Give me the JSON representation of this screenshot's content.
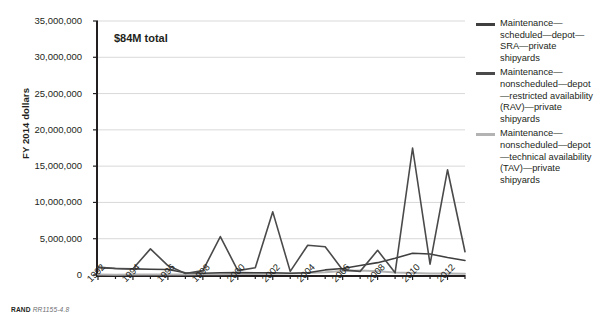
{
  "figure": {
    "annotation": "$84M total",
    "source_note_prefix": "RAND",
    "source_note_id": "RR1155-4.8"
  },
  "yaxis": {
    "title": "FY 2014 dollars",
    "ticks": [
      "0",
      "5,000,000",
      "10,000,000",
      "15,000,000",
      "20,000,000",
      "25,000,000",
      "30,000,000",
      "35,000,000"
    ],
    "tick_values": [
      0,
      5000000,
      10000000,
      15000000,
      20000000,
      25000000,
      30000000,
      35000000
    ],
    "min": 0,
    "max": 35000000
  },
  "xaxis": {
    "ticks": [
      "1992",
      "1994",
      "1996",
      "1998",
      "2000",
      "2002",
      "2004",
      "2006",
      "2008",
      "2010",
      "2012"
    ],
    "min": 1992,
    "max": 2013
  },
  "legend": {
    "items": [
      {
        "label": "Maintenance—scheduled—depot—SRA—private shipyards",
        "color": "#3f3f3f"
      },
      {
        "label": "Maintenance—nonscheduled—depot—restricted availability (RAV)—private shipyards",
        "color": "#4a4a4a"
      },
      {
        "label": "Maintenance—nonscheduled—depot—technical availability (TAV)—private shipyards",
        "color": "#b3b3b3"
      }
    ]
  },
  "chart_data": {
    "type": "line",
    "title": "",
    "xlabel": "",
    "ylabel": "FY 2014 dollars",
    "xlim": [
      1992,
      2013
    ],
    "ylim": [
      0,
      35000000
    ],
    "grid": "horizontal",
    "legend_position": "right",
    "annotations": [
      {
        "text": "$84M total",
        "x": 1993.2,
        "y": 32500000
      }
    ],
    "x": [
      1992,
      1993,
      1994,
      1995,
      1996,
      1997,
      1998,
      1999,
      2000,
      2001,
      2002,
      2003,
      2004,
      2005,
      2006,
      2007,
      2008,
      2009,
      2010,
      2011,
      2012,
      2013
    ],
    "series": [
      {
        "name": "Maintenance—scheduled—depot—SRA—private shipyards",
        "color": "#3f3f3f",
        "values": [
          1000000,
          900000,
          850000,
          800000,
          750000,
          300000,
          250000,
          300000,
          350000,
          300000,
          300000,
          250000,
          300000,
          700000,
          900000,
          1300000,
          1700000,
          2300000,
          3000000,
          2900000,
          2400000,
          2000000
        ]
      },
      {
        "name": "Maintenance—nonscheduled—depot—restricted availability (RAV)—private shipyards",
        "color": "#4a4a4a",
        "values": [
          1100000,
          900000,
          850000,
          3600000,
          1300000,
          200000,
          600000,
          5300000,
          600000,
          1000000,
          8700000,
          500000,
          4100000,
          3900000,
          700000,
          500000,
          3400000,
          300000,
          17500000,
          1500000,
          14500000,
          3200000
        ]
      },
      {
        "name": "Maintenance—nonscheduled—depot—technical availability (TAV)—private shipyards",
        "color": "#b3b3b3",
        "values": [
          60000,
          50000,
          60000,
          80000,
          70000,
          60000,
          90000,
          110000,
          130000,
          150000,
          180000,
          200000,
          260000,
          380000,
          560000,
          620000,
          500000,
          330000,
          260000,
          220000,
          200000,
          180000
        ]
      }
    ]
  }
}
